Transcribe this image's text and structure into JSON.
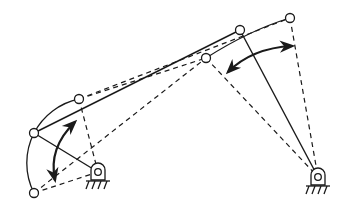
{
  "diagram": {
    "type": "four-bar-linkage-mechanism",
    "colors": {
      "line": "#1a1a1a",
      "background": "#ffffff"
    },
    "ground_pivots": [
      {
        "id": "left-ground-pivot",
        "x": 98,
        "y": 172
      },
      {
        "id": "right-ground-pivot",
        "x": 318,
        "y": 177
      }
    ],
    "joints": [
      {
        "id": "crank-joint-main",
        "x": 34,
        "y": 133
      },
      {
        "id": "crank-joint-upper",
        "x": 79,
        "y": 99
      },
      {
        "id": "crank-joint-lower",
        "x": 34,
        "y": 193
      },
      {
        "id": "rocker-joint-main",
        "x": 240,
        "y": 30
      },
      {
        "id": "rocker-joint-left",
        "x": 206,
        "y": 58
      },
      {
        "id": "rocker-joint-right",
        "x": 290,
        "y": 18
      }
    ],
    "arrows": [
      {
        "id": "left-oscillation-arrow",
        "label": "crank oscillation"
      },
      {
        "id": "right-oscillation-arrow",
        "label": "rocker oscillation"
      }
    ]
  }
}
